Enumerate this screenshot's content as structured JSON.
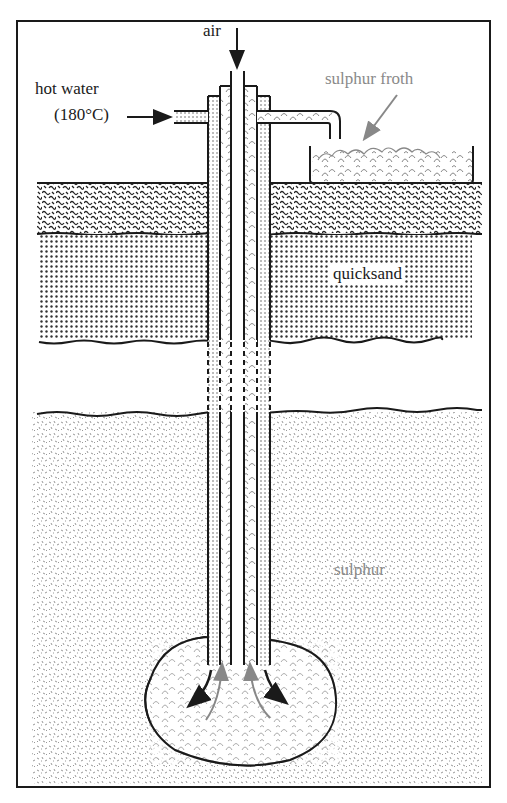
{
  "diagram": {
    "type": "Frasch process sulphur extraction",
    "labels": {
      "air": "air",
      "hot_water": "hot water",
      "temperature": "(180°C)",
      "sulphur_froth": "sulphur froth",
      "quicksand": "quicksand",
      "sulphur": "sulphur"
    },
    "layers": [
      "topsoil",
      "quicksand",
      "rock (gap)",
      "sulphur deposit"
    ],
    "colors": {
      "line": "#1a1a1a",
      "label_grey": "#8a8a8a",
      "background": "#ffffff"
    }
  }
}
